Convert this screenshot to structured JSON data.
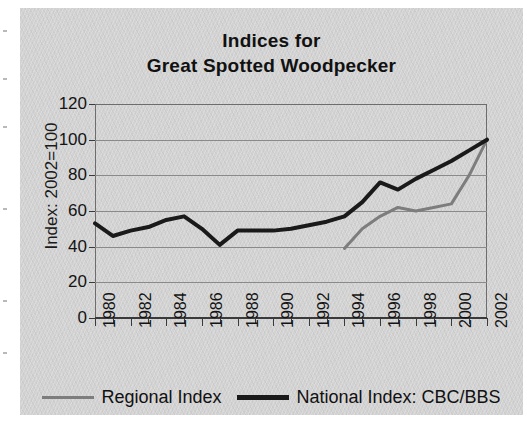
{
  "chart_data": {
    "type": "line",
    "title": "Indices for Great Spotted Woodpecker",
    "title_lines": [
      "Indices for",
      "Great Spotted Woodpecker"
    ],
    "xlabel": "",
    "ylabel": "Index: 2002=100",
    "ylim": [
      0,
      120
    ],
    "ytick_values": [
      0,
      20,
      40,
      60,
      80,
      100,
      120
    ],
    "ytick_labels": [
      "0",
      "20",
      "40",
      "60",
      "80",
      "100",
      "120"
    ],
    "xlim": [
      1980,
      2002
    ],
    "x": [
      1980,
      1981,
      1982,
      1983,
      1984,
      1985,
      1986,
      1987,
      1988,
      1989,
      1990,
      1991,
      1992,
      1993,
      1994,
      1995,
      1996,
      1997,
      1998,
      1999,
      2000,
      2001,
      2002
    ],
    "xtick_values": [
      1980,
      1982,
      1984,
      1986,
      1988,
      1990,
      1992,
      1994,
      1996,
      1998,
      2000,
      2002
    ],
    "xtick_labels": [
      "1980",
      "1982",
      "1984",
      "1986",
      "1988",
      "1990",
      "1992",
      "1994",
      "1996",
      "1998",
      "2000",
      "2002"
    ],
    "grid": true,
    "grid_axis": "y",
    "legend_position": "bottom",
    "series": [
      {
        "name": "Regional Index",
        "color": "#7d7d7d",
        "line_width": 3,
        "x": [
          1994,
          1995,
          1996,
          1997,
          1998,
          1999,
          2000,
          2001,
          2002
        ],
        "values": [
          39,
          50,
          57,
          62,
          60,
          62,
          64,
          80,
          100
        ]
      },
      {
        "name": "National Index: CBC/BBS",
        "color": "#1a1a1a",
        "line_width": 4,
        "x": [
          1980,
          1981,
          1982,
          1983,
          1984,
          1985,
          1986,
          1987,
          1988,
          1989,
          1990,
          1991,
          1992,
          1993,
          1994,
          1995,
          1996,
          1997,
          1998,
          1999,
          2000,
          2001,
          2002
        ],
        "values": [
          53,
          46,
          49,
          51,
          55,
          57,
          50,
          41,
          49,
          49,
          49,
          50,
          52,
          54,
          57,
          65,
          76,
          72,
          78,
          83,
          88,
          94,
          100
        ]
      }
    ]
  },
  "legend": {
    "entries": [
      {
        "label": "Regional Index",
        "color": "#7d7d7d",
        "weight": "thin"
      },
      {
        "label": "National Index: CBC/BBS",
        "color": "#1a1a1a",
        "weight": "bold"
      }
    ]
  },
  "colors": {
    "background": "#d2d2d2",
    "page": "#ffffff",
    "gridline": "#8a8a8a",
    "axis": "#3a3a3a",
    "text": "#141414",
    "regional": "#7d7d7d",
    "national": "#1a1a1a"
  }
}
